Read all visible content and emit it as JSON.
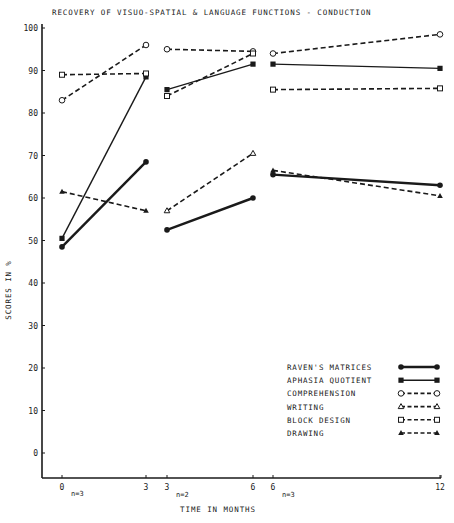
{
  "chart_data": {
    "type": "line",
    "title": "RECOVERY OF VISUO-SPATIAL & LANGUAGE FUNCTIONS - CONDUCTION",
    "xlabel": "TIME IN MONTHS",
    "ylabel": "SCORES IN %",
    "ylim": [
      0,
      100
    ],
    "yticks": [
      0,
      10,
      20,
      30,
      40,
      50,
      60,
      70,
      80,
      90,
      100
    ],
    "grid": false,
    "legend_position": "lower right",
    "groups": [
      {
        "label": "n=3",
        "x": [
          0,
          3
        ],
        "series": [
          {
            "name": "RAVEN'S MATRICES",
            "values": [
              48.5,
              68.5
            ]
          },
          {
            "name": "APHASIA QUOTIENT",
            "values": [
              50.5,
              88.5
            ]
          },
          {
            "name": "COMPREHENSION",
            "values": [
              83,
              96
            ]
          },
          {
            "name": "BLOCK DESIGN",
            "values": [
              89,
              89.3
            ]
          },
          {
            "name": "DRAWING",
            "values": [
              61.5,
              57
            ]
          }
        ]
      },
      {
        "label": "n=2",
        "x": [
          3,
          6
        ],
        "series": [
          {
            "name": "RAVEN'S MATRICES",
            "values": [
              52.5,
              60
            ]
          },
          {
            "name": "APHASIA QUOTIENT",
            "values": [
              85.5,
              91.5
            ]
          },
          {
            "name": "COMPREHENSION",
            "values": [
              95,
              94.5
            ]
          },
          {
            "name": "WRITING",
            "values": [
              57,
              70.5
            ]
          },
          {
            "name": "BLOCK DESIGN",
            "values": [
              84,
              94
            ]
          }
        ]
      },
      {
        "label": "n=3",
        "x": [
          6,
          12
        ],
        "series": [
          {
            "name": "RAVEN'S MATRICES",
            "values": [
              65.5,
              63
            ]
          },
          {
            "name": "APHASIA QUOTIENT",
            "values": [
              91.5,
              90.5
            ]
          },
          {
            "name": "COMPREHENSION",
            "values": [
              94,
              98.5
            ]
          },
          {
            "name": "BLOCK DESIGN",
            "values": [
              85.5,
              85.8
            ]
          },
          {
            "name": "DRAWING",
            "values": [
              66.5,
              60.5
            ]
          }
        ]
      }
    ],
    "xtick_labels": [
      "0",
      "3",
      "3",
      "6",
      "6",
      "12"
    ],
    "legend": [
      {
        "name": "RAVEN'S MATRICES",
        "marker": "filled-circle",
        "line": "thick-solid"
      },
      {
        "name": "APHASIA QUOTIENT",
        "marker": "filled-square",
        "line": "solid"
      },
      {
        "name": "COMPREHENSION",
        "marker": "open-circle",
        "line": "dashed"
      },
      {
        "name": "WRITING",
        "marker": "open-triangle",
        "line": "dashed"
      },
      {
        "name": "BLOCK DESIGN",
        "marker": "open-square",
        "line": "dashed"
      },
      {
        "name": "DRAWING",
        "marker": "filled-triangle",
        "line": "dashed"
      }
    ]
  },
  "labels": {
    "title": "RECOVERY OF VISUO-SPATIAL & LANGUAGE FUNCTIONS - CONDUCTION",
    "ylabel": "SCORES IN %",
    "xlabel": "TIME IN MONTHS",
    "n1": "n=3",
    "n2": "n=2",
    "n3": "n=3"
  }
}
